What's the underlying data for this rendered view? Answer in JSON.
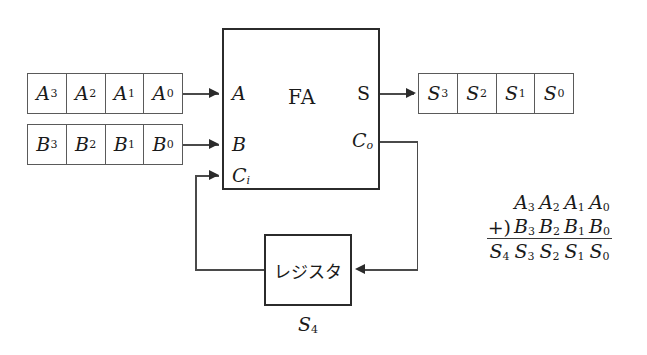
{
  "diagram": {
    "background_color": "#ffffff",
    "line_color": "#4a4a4a",
    "box_border_color": "#2b2b2b"
  },
  "registers": {
    "a_register": {
      "name": "A register",
      "cells": [
        {
          "base": "A",
          "sub": "3"
        },
        {
          "base": "A",
          "sub": "2"
        },
        {
          "base": "A",
          "sub": "1"
        },
        {
          "base": "A",
          "sub": "0"
        }
      ]
    },
    "b_register": {
      "name": "B register",
      "cells": [
        {
          "base": "B",
          "sub": "3"
        },
        {
          "base": "B",
          "sub": "2"
        },
        {
          "base": "B",
          "sub": "1"
        },
        {
          "base": "B",
          "sub": "0"
        }
      ]
    },
    "s_register": {
      "name": "S register",
      "cells": [
        {
          "base": "S",
          "sub": "3"
        },
        {
          "base": "S",
          "sub": "2"
        },
        {
          "base": "S",
          "sub": "1"
        },
        {
          "base": "S",
          "sub": "0"
        }
      ]
    }
  },
  "fa_block": {
    "title": "FA",
    "inputs": [
      {
        "base": "A",
        "sub": ""
      },
      {
        "base": "B",
        "sub": ""
      },
      {
        "base": "C",
        "sub": "i"
      }
    ],
    "outputs": [
      {
        "base": "S",
        "sub": ""
      },
      {
        "base": "C",
        "sub": "o"
      }
    ]
  },
  "carry_register": {
    "label": "レジスタ",
    "below_label": {
      "base": "S",
      "sub": "4"
    }
  },
  "addition": {
    "operator": "+)",
    "augend": [
      {
        "base": "A",
        "sub": "3"
      },
      {
        "base": "A",
        "sub": "2"
      },
      {
        "base": "A",
        "sub": "1"
      },
      {
        "base": "A",
        "sub": "0"
      }
    ],
    "addend": [
      {
        "base": "B",
        "sub": "3"
      },
      {
        "base": "B",
        "sub": "2"
      },
      {
        "base": "B",
        "sub": "1"
      },
      {
        "base": "B",
        "sub": "0"
      }
    ],
    "sum": [
      {
        "base": "S",
        "sub": "4"
      },
      {
        "base": "S",
        "sub": "3"
      },
      {
        "base": "S",
        "sub": "2"
      },
      {
        "base": "S",
        "sub": "1"
      },
      {
        "base": "S",
        "sub": "0"
      }
    ]
  }
}
